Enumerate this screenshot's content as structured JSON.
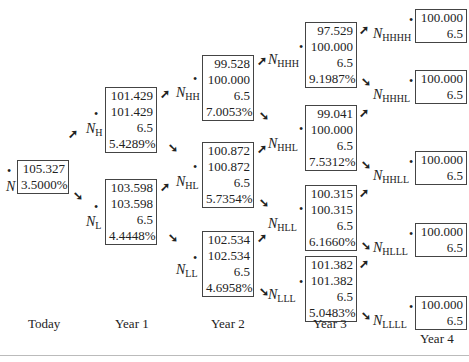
{
  "diagram": {
    "type": "binomial interest rate tree (bond valuation)",
    "periods": [
      "Today",
      "Year 1",
      "Year 2",
      "Year 3",
      "Year 4"
    ],
    "nodes": [
      {
        "id": "N",
        "label": "N",
        "sub": "",
        "values": [
          "105.327",
          "3.5000%"
        ]
      },
      {
        "id": "NH",
        "label": "N",
        "sub": "H",
        "values": [
          "101.429",
          "101.429",
          "6.5",
          "5.4289%"
        ]
      },
      {
        "id": "NL",
        "label": "N",
        "sub": "L",
        "values": [
          "103.598",
          "103.598",
          "6.5",
          "4.4448%"
        ]
      },
      {
        "id": "NHH",
        "label": "N",
        "sub": "HH",
        "values": [
          "99.528",
          "100.000",
          "6.5",
          "7.0053%"
        ]
      },
      {
        "id": "NHL",
        "label": "N",
        "sub": "HL",
        "values": [
          "100.872",
          "100.872",
          "6.5",
          "5.7354%"
        ]
      },
      {
        "id": "NLL",
        "label": "N",
        "sub": "LL",
        "values": [
          "102.534",
          "102.534",
          "6.5",
          "4.6958%"
        ]
      },
      {
        "id": "NHHH",
        "label": "N",
        "sub": "HHH",
        "values": [
          "97.529",
          "100.000",
          "6.5",
          "9.1987%"
        ]
      },
      {
        "id": "NHHL",
        "label": "N",
        "sub": "HHL",
        "values": [
          "99.041",
          "100.000",
          "6.5",
          "7.5312%"
        ]
      },
      {
        "id": "NHLL",
        "label": "N",
        "sub": "HLL",
        "values": [
          "100.315",
          "100.315",
          "6.5",
          "6.1660%"
        ]
      },
      {
        "id": "NLLL",
        "label": "N",
        "sub": "LLL",
        "values": [
          "101.382",
          "101.382",
          "6.5",
          "5.0483%"
        ]
      },
      {
        "id": "NHHHH",
        "label": "N",
        "sub": "HHHH",
        "values": [
          "100.000",
          "6.5"
        ]
      },
      {
        "id": "NHHHL",
        "label": "N",
        "sub": "HHHL",
        "values": [
          "100.000",
          "6.5"
        ]
      },
      {
        "id": "NHHLL",
        "label": "N",
        "sub": "HHLL",
        "values": [
          "100.000",
          "6.5"
        ]
      },
      {
        "id": "NHLLL",
        "label": "N",
        "sub": "HLLL",
        "values": [
          "100.000",
          "6.5"
        ]
      },
      {
        "id": "NLLLL",
        "label": "N",
        "sub": "LLLL",
        "values": [
          "100.000",
          "6.5"
        ]
      }
    ],
    "arrow_up": "➚",
    "arrow_down": "➘",
    "dot": "•"
  }
}
